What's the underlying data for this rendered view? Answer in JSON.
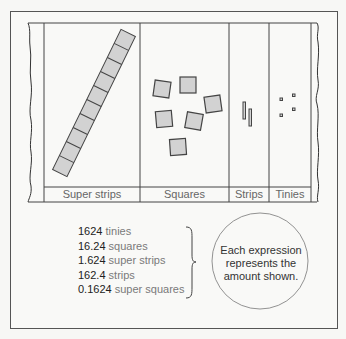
{
  "diagram": {
    "columns": [
      {
        "label": "Super strips",
        "shape": "super-strip",
        "count": 1,
        "units_per_item": 10
      },
      {
        "label": "Squares",
        "shape": "square",
        "count": 6
      },
      {
        "label": "Strips",
        "shape": "strip",
        "count": 2
      },
      {
        "label": "Tinies",
        "shape": "tiny",
        "count": 4
      }
    ],
    "expressions": [
      {
        "number": "1624",
        "unit": "tinies"
      },
      {
        "number": "16.24",
        "unit": "squares"
      },
      {
        "number": "1.624",
        "unit": "super strips"
      },
      {
        "number": "162.4",
        "unit": "strips"
      },
      {
        "number": "0.1624",
        "unit": "super squares"
      }
    ],
    "callout": {
      "line1": "Each expression",
      "line2": "represents the",
      "line3": "amount shown."
    },
    "colors": {
      "shape_fill": "#d2d2d2",
      "stroke": "#444444",
      "background": "#f9f9f7"
    }
  }
}
